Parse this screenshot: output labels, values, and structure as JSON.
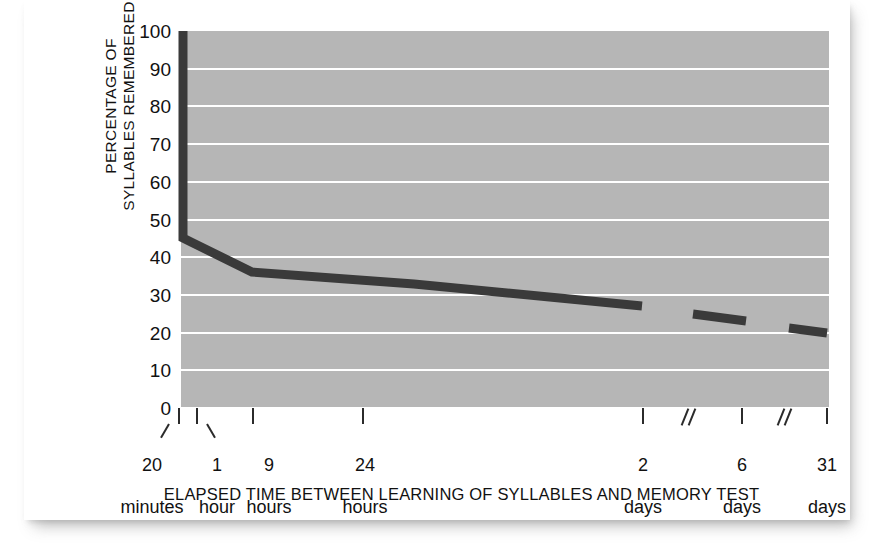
{
  "chart_data": {
    "type": "line",
    "title": "",
    "xlabel": "ELAPSED TIME BETWEEN LEARNING OF SYLLABLES AND MEMORY TEST",
    "ylabel": "PERCENTAGE OF\nSYLLABLES REMEMBERED",
    "ylim": [
      0,
      100
    ],
    "yticks": [
      100,
      90,
      80,
      70,
      60,
      50,
      40,
      30,
      20,
      10,
      0
    ],
    "grid": "horizontal-white-gridlines",
    "legend": "none",
    "x_categories": [
      "0",
      "20 minutes",
      "1 hour",
      "9 hours",
      "24 hours",
      "2 days",
      "6 days",
      "31 days"
    ],
    "xtick_labels": [
      {
        "value": "20",
        "unit": "minutes"
      },
      {
        "value": "1",
        "unit": "hour"
      },
      {
        "value": "9",
        "unit": "hours"
      },
      {
        "value": "24",
        "unit": "hours"
      },
      {
        "value": "2",
        "unit": "days"
      },
      {
        "value": "6",
        "unit": "days"
      },
      {
        "value": "31",
        "unit": "days"
      }
    ],
    "axis_breaks": [
      "between 2 days and 6 days",
      "between 6 days and 31 days"
    ],
    "series": [
      {
        "name": "Percentage of syllables remembered",
        "points": [
          {
            "x": "immediately",
            "y": 100
          },
          {
            "x": "20 minutes",
            "y": 45
          },
          {
            "x": "1 hour",
            "y": 44
          },
          {
            "x": "9 hours",
            "y": 36
          },
          {
            "x": "24 hours",
            "y": 33
          },
          {
            "x": "2 days",
            "y": 27
          },
          {
            "x": "6 days",
            "y": 25
          },
          {
            "x": "31 days",
            "y": 21
          }
        ]
      }
    ],
    "colors": {
      "plot_background": "#b6b6b6",
      "gridline": "#ffffff",
      "line": "#3a3a3a",
      "text": "#111111",
      "card_background": "#ffffff"
    }
  },
  "axis": {
    "y_title_line1": "PERCENTAGE OF",
    "y_title_line2": "SYLLABLES REMEMBERED",
    "y_ticks": [
      "100",
      "90",
      "80",
      "70",
      "60",
      "50",
      "40",
      "30",
      "20",
      "10",
      "0"
    ],
    "x_title": "ELAPSED TIME BETWEEN LEARNING OF SYLLABLES AND MEMORY TEST",
    "x_ticks": [
      {
        "num": "20",
        "unit": "minutes"
      },
      {
        "num": "1",
        "unit": "hour"
      },
      {
        "num": "9",
        "unit": "hours"
      },
      {
        "num": "24",
        "unit": "hours"
      },
      {
        "num": "2",
        "unit": "days"
      },
      {
        "num": "6",
        "unit": "days"
      },
      {
        "num": "31",
        "unit": "days"
      }
    ]
  }
}
